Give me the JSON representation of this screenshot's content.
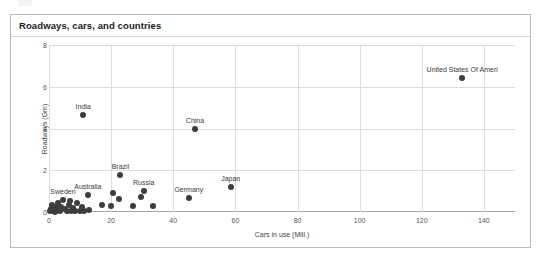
{
  "chart_data": {
    "type": "scatter",
    "title": "Roadways, cars, and countries",
    "xlabel": "Cars in use (Mill.)",
    "ylabel": "Roadways (Gm)",
    "xlim": [
      0,
      150
    ],
    "ylim": [
      0,
      8
    ],
    "xticks": [
      0,
      20,
      40,
      60,
      80,
      100,
      120,
      140
    ],
    "yticks": [
      0,
      2,
      4,
      6,
      8
    ],
    "grid": true,
    "legend": "none",
    "marker_color": "#3d3d3d",
    "points": [
      {
        "label": "United States Of Ameri",
        "x": 133.0,
        "y": 6.43,
        "labeled": true
      },
      {
        "label": "India",
        "x": 11.0,
        "y": 4.65,
        "labeled": true
      },
      {
        "label": "China",
        "x": 47.0,
        "y": 4.0,
        "labeled": true
      },
      {
        "label": "Brazil",
        "x": 23.0,
        "y": 1.75,
        "labeled": true
      },
      {
        "label": "Russia",
        "x": 30.5,
        "y": 1.0,
        "labeled": true
      },
      {
        "label": "Japan",
        "x": 58.5,
        "y": 1.2,
        "labeled": true
      },
      {
        "label": "Germany",
        "x": 45.0,
        "y": 0.65,
        "labeled": true
      },
      {
        "label": "Australia",
        "x": 12.5,
        "y": 0.82,
        "labeled": true
      },
      {
        "label": "Sweden",
        "x": 4.5,
        "y": 0.57,
        "labeled": true
      },
      {
        "label": "",
        "x": 20.5,
        "y": 0.9,
        "labeled": false
      },
      {
        "label": "",
        "x": 22.5,
        "y": 0.63,
        "labeled": false
      },
      {
        "label": "",
        "x": 29.5,
        "y": 0.74,
        "labeled": false
      },
      {
        "label": "",
        "x": 17.0,
        "y": 0.35,
        "labeled": false
      },
      {
        "label": "",
        "x": 20.0,
        "y": 0.3,
        "labeled": false
      },
      {
        "label": "",
        "x": 27.0,
        "y": 0.3,
        "labeled": false
      },
      {
        "label": "",
        "x": 33.5,
        "y": 0.3,
        "labeled": false
      },
      {
        "label": "",
        "x": 12.8,
        "y": 0.08,
        "labeled": false
      },
      {
        "label": "",
        "x": 9.0,
        "y": 0.42,
        "labeled": false
      },
      {
        "label": "",
        "x": 7.6,
        "y": 0.18,
        "labeled": false
      },
      {
        "label": "",
        "x": 6.3,
        "y": 0.33,
        "labeled": false
      },
      {
        "label": "",
        "x": 5.2,
        "y": 0.12,
        "labeled": false
      },
      {
        "label": "",
        "x": 4.0,
        "y": 0.22,
        "labeled": false
      },
      {
        "label": "",
        "x": 3.1,
        "y": 0.1,
        "labeled": false
      },
      {
        "label": "",
        "x": 2.2,
        "y": 0.26,
        "labeled": false
      },
      {
        "label": "",
        "x": 1.4,
        "y": 0.07,
        "labeled": false
      },
      {
        "label": "",
        "x": 0.7,
        "y": 0.16,
        "labeled": false
      },
      {
        "label": "",
        "x": 0.3,
        "y": 0.05,
        "labeled": false
      },
      {
        "label": "",
        "x": 1.9,
        "y": 0.02,
        "labeled": false
      },
      {
        "label": "",
        "x": 3.6,
        "y": 0.03,
        "labeled": false
      },
      {
        "label": "",
        "x": 5.8,
        "y": 0.04,
        "labeled": false
      },
      {
        "label": "",
        "x": 7.0,
        "y": 0.05,
        "labeled": false
      },
      {
        "label": "",
        "x": 8.4,
        "y": 0.06,
        "labeled": false
      },
      {
        "label": "",
        "x": 9.9,
        "y": 0.04,
        "labeled": false
      },
      {
        "label": "",
        "x": 11.2,
        "y": 0.05,
        "labeled": false
      },
      {
        "label": "",
        "x": 2.8,
        "y": 0.45,
        "labeled": false
      },
      {
        "label": "",
        "x": 6.9,
        "y": 0.52,
        "labeled": false
      },
      {
        "label": "",
        "x": 10.6,
        "y": 0.25,
        "labeled": false
      },
      {
        "label": "",
        "x": 0.9,
        "y": 0.35,
        "labeled": false
      }
    ]
  }
}
